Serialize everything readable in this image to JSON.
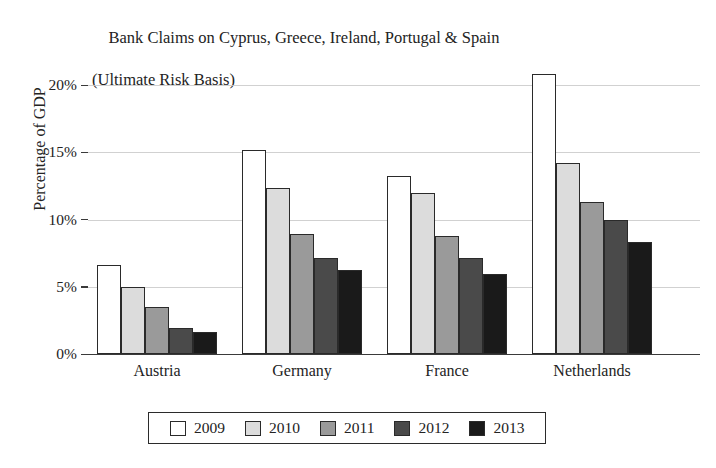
{
  "chart_data": {
    "type": "bar",
    "title": "Bank Claims on Cyprus, Greece, Ireland, Portugal & Spain",
    "subtitle": "(Ultimate Risk Basis)",
    "xlabel": "",
    "ylabel": "Percentage of GDP",
    "categories": [
      "Austria",
      "Germany",
      "France",
      "Netherlands"
    ],
    "series": [
      {
        "name": "2009",
        "color": "#ffffff",
        "values": [
          6.6,
          15.2,
          13.25,
          20.85
        ]
      },
      {
        "name": "2010",
        "color": "#dcdcdc",
        "values": [
          5.0,
          12.35,
          12.0,
          14.2
        ]
      },
      {
        "name": "2011",
        "color": "#9a9a9a",
        "values": [
          3.5,
          8.9,
          8.75,
          11.3
        ]
      },
      {
        "name": "2012",
        "color": "#4a4a4a",
        "values": [
          1.9,
          7.15,
          7.15,
          10.0
        ]
      },
      {
        "name": "2013",
        "color": "#1a1a1a",
        "values": [
          1.6,
          6.25,
          5.95,
          8.35
        ]
      }
    ],
    "ylim": [
      0,
      21.85
    ],
    "yticks": [
      0,
      5,
      10,
      15,
      20
    ],
    "ytick_labels": [
      "0%",
      "5%",
      "10%",
      "15%",
      "20%"
    ],
    "grid": true,
    "legend_position": "bottom",
    "legend_entries": [
      "2009",
      "2010",
      "2011",
      "2012",
      "2013"
    ]
  }
}
